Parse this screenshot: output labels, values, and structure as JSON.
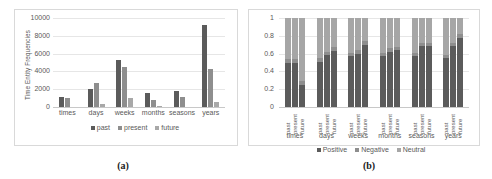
{
  "figure": {
    "panels": [
      {
        "caption": "(a)",
        "ylabel": "Time Entity Frequencies",
        "legend": [
          "past",
          "present",
          "future"
        ]
      },
      {
        "caption": "(b)",
        "ylabel": "",
        "legend": [
          "Positive",
          "Negative",
          "Neutral"
        ],
        "sublabels": [
          "past",
          "present",
          "future"
        ]
      }
    ]
  },
  "colors": {
    "past": "#5b5b5b",
    "present": "#8e8e8e",
    "future": "#a8a8a8",
    "positive": "#5b5b5b",
    "negative": "#8e8e8e",
    "neutral": "#a6a6a6",
    "grid": "#e6e6e6",
    "frame": "#d9d9d9",
    "text": "#595959"
  },
  "chart_data": [
    {
      "type": "bar",
      "title": "(a)",
      "xlabel": "",
      "ylabel": "Time Entity Frequencies",
      "categories": [
        "times",
        "days",
        "weeks",
        "months",
        "seasons",
        "years"
      ],
      "yticks": [
        0,
        2000,
        4000,
        6000,
        8000,
        10000
      ],
      "ylim": [
        0,
        10000
      ],
      "grid": true,
      "legend_position": "bottom",
      "series": [
        {
          "name": "past",
          "values": [
            1100,
            2000,
            5250,
            1600,
            1750,
            9200
          ]
        },
        {
          "name": "present",
          "values": [
            1050,
            2750,
            4500,
            750,
            1100,
            4300
          ]
        },
        {
          "name": "future",
          "values": [
            0,
            300,
            1000,
            100,
            0,
            600
          ]
        }
      ]
    },
    {
      "type": "bar",
      "subtype": "stacked-100",
      "title": "(b)",
      "xlabel": "",
      "ylabel": "",
      "categories": [
        "times",
        "days",
        "weeks",
        "months",
        "seasons",
        "years"
      ],
      "subcategories": [
        "past",
        "present",
        "future"
      ],
      "yticks": [
        0,
        0.2,
        0.4,
        0.6,
        0.8,
        1
      ],
      "ylim": [
        0,
        1
      ],
      "grid": true,
      "legend_position": "bottom",
      "series": [
        {
          "name": "Positive",
          "values": [
            [
              0.5,
              0.5,
              0.25
            ],
            [
              0.51,
              0.58,
              0.63
            ],
            [
              0.57,
              0.6,
              0.7
            ],
            [
              0.57,
              0.62,
              0.64
            ],
            [
              0.57,
              0.68,
              0.68
            ],
            [
              0.55,
              0.68,
              0.78
            ]
          ]
        },
        {
          "name": "Negative",
          "values": [
            [
              0.04,
              0.04,
              0.04
            ],
            [
              0.04,
              0.04,
              0.04
            ],
            [
              0.04,
              0.04,
              0.04
            ],
            [
              0.04,
              0.04,
              0.04
            ],
            [
              0.04,
              0.04,
              0.04
            ],
            [
              0.04,
              0.04,
              0.04
            ]
          ]
        },
        {
          "name": "Neutral",
          "values": [
            [
              0.46,
              0.46,
              0.71
            ],
            [
              0.45,
              0.38,
              0.33
            ],
            [
              0.39,
              0.36,
              0.26
            ],
            [
              0.39,
              0.34,
              0.32
            ],
            [
              0.39,
              0.28,
              0.28
            ],
            [
              0.41,
              0.28,
              0.18
            ]
          ]
        }
      ]
    }
  ]
}
